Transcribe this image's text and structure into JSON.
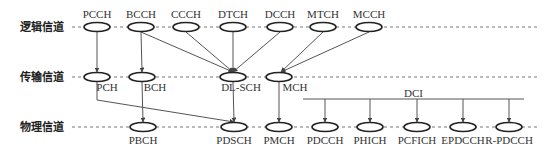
{
  "rows": [
    {
      "label": "逻辑信道",
      "y": 27
    },
    {
      "label": "传输信道",
      "y": 77
    },
    {
      "label": "物理信道",
      "y": 127
    }
  ],
  "logical": [
    {
      "name": "PCCH",
      "x": 97
    },
    {
      "name": "BCCH",
      "x": 141
    },
    {
      "name": "CCCH",
      "x": 186
    },
    {
      "name": "DTCH",
      "x": 233
    },
    {
      "name": "DCCH",
      "x": 280
    },
    {
      "name": "MTCH",
      "x": 323
    },
    {
      "name": "MCCH",
      "x": 369
    }
  ],
  "transport": [
    {
      "name": "PCH",
      "x": 97
    },
    {
      "name": "BCH",
      "x": 142
    },
    {
      "name": "DL-SCH",
      "x": 233
    },
    {
      "name": "MCH",
      "x": 279
    }
  ],
  "physical": [
    {
      "name": "PBCH",
      "x": 143
    },
    {
      "name": "PDSCH",
      "x": 234
    },
    {
      "name": "PMCH",
      "x": 279
    },
    {
      "name": "PDCCH",
      "x": 325
    },
    {
      "name": "PHICH",
      "x": 370
    },
    {
      "name": "PCFICH",
      "x": 417
    },
    {
      "name": "EPDCCH",
      "x": 463
    },
    {
      "name": "R-PDCCH",
      "x": 509
    }
  ],
  "dci": {
    "label": "DCI",
    "x1": 303,
    "x2": 524,
    "y": 99
  },
  "colors": {
    "line": "#555555",
    "ellipse": "#222222",
    "dash": "#777777"
  }
}
